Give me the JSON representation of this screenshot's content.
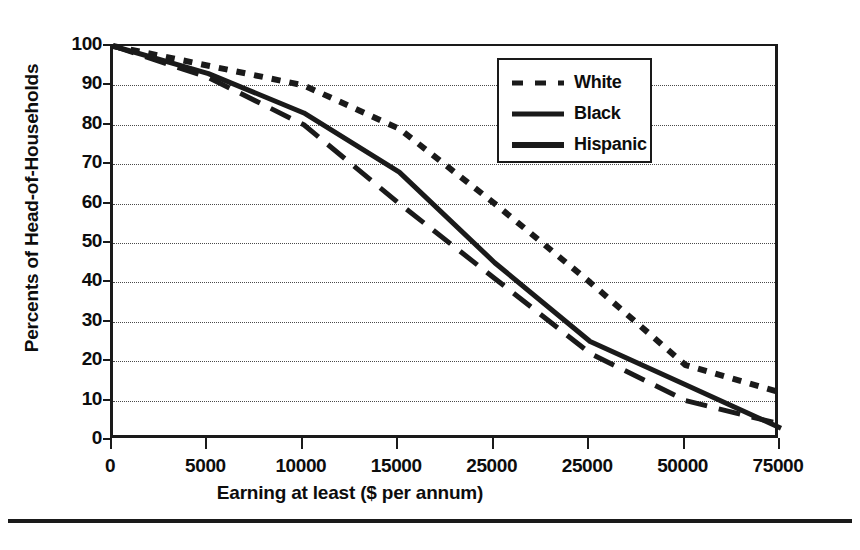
{
  "chart_data": {
    "type": "line",
    "title": "",
    "xlabel": "Earning at least ($ per annum)",
    "ylabel": "Percents of Head-of-Households",
    "xlim": [
      0,
      7
    ],
    "ylim": [
      0,
      100
    ],
    "grid": true,
    "legend_position": "upper-right",
    "x_tick_labels": [
      "0",
      "5000",
      "10000",
      "15000",
      "25000",
      "25000",
      "50000",
      "75000"
    ],
    "y_tick_labels": [
      "0",
      "10",
      "20",
      "30",
      "40",
      "50",
      "60",
      "70",
      "80",
      "90",
      "100"
    ],
    "y_ticks": [
      0,
      10,
      20,
      30,
      40,
      50,
      60,
      70,
      80,
      90,
      100
    ],
    "x_positions": [
      0,
      1,
      2,
      3,
      4,
      5,
      6,
      7
    ],
    "series": [
      {
        "name": "White",
        "style": "dotted",
        "color": "#1a1a1a",
        "values": [
          100,
          95,
          90,
          79,
          60,
          40,
          19,
          12
        ]
      },
      {
        "name": "Black",
        "style": "dashed",
        "color": "#1a1a1a",
        "values": [
          100,
          92,
          80,
          60,
          41,
          22,
          10,
          4
        ]
      },
      {
        "name": "Hispanic",
        "style": "solid",
        "color": "#1a1a1a",
        "values": [
          100,
          93,
          83,
          68,
          45,
          25,
          14,
          3
        ]
      }
    ]
  },
  "legend": {
    "items": [
      {
        "label": "White",
        "style": "dotted"
      },
      {
        "label": "Black",
        "style": "dashed"
      },
      {
        "label": "Hispanic",
        "style": "solid"
      }
    ]
  },
  "axes": {
    "x_title": "Earning at least ($ per annum)",
    "y_title": "Percents of Head-of-Households"
  }
}
